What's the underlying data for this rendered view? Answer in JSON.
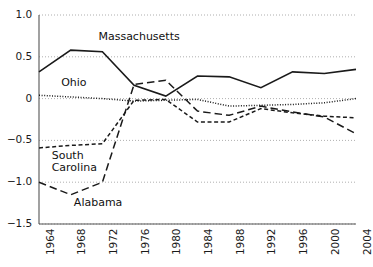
{
  "chart_data": {
    "type": "line",
    "title": "",
    "subtitle": "",
    "xlabel": "",
    "ylabel": "",
    "x": [
      1964,
      1968,
      1972,
      1976,
      1980,
      1984,
      1988,
      1992,
      1996,
      2000,
      2004
    ],
    "xticklabels": [
      "1964",
      "1968",
      "1972",
      "1976",
      "1980",
      "1984",
      "1988",
      "1992",
      "1996",
      "2000",
      "2004"
    ],
    "yticks": [
      1.0,
      0.5,
      0,
      -0.5,
      -1.0,
      -1.5
    ],
    "yticklabels": [
      "1.0",
      "0.5",
      "0",
      "−0.5",
      "−1.0",
      "−1.5"
    ],
    "ylim": [
      -1.5,
      1.0
    ],
    "xlim": [
      1964,
      2004
    ],
    "grid": "horizontal-dotted",
    "legend_position": "inline-annotations",
    "series": [
      {
        "name": "Massachusetts",
        "style": "solid",
        "color": "#1a1a1a",
        "values": [
          0.32,
          0.58,
          0.56,
          0.16,
          0.03,
          0.27,
          0.26,
          0.13,
          0.32,
          0.3,
          0.35
        ]
      },
      {
        "name": "Ohio",
        "style": "dotted",
        "color": "#1a1a1a",
        "values": [
          0.04,
          0.02,
          0.0,
          -0.03,
          -0.02,
          -0.01,
          -0.09,
          -0.08,
          -0.07,
          -0.05,
          0.0
        ]
      },
      {
        "name": "South Carolina",
        "style": "dashed-short",
        "color": "#1a1a1a",
        "values": [
          -0.59,
          -0.56,
          -0.54,
          -0.02,
          -0.01,
          -0.28,
          -0.28,
          -0.12,
          -0.17,
          -0.21,
          -0.23
        ]
      },
      {
        "name": "Alabama",
        "style": "dashed-long",
        "color": "#1a1a1a",
        "values": [
          -1.0,
          -1.15,
          -1.0,
          0.17,
          0.22,
          -0.15,
          -0.2,
          -0.09,
          -0.16,
          -0.22,
          -0.42
        ]
      }
    ],
    "annotations": [
      {
        "text": "Massachusetts",
        "series": "Massachusetts",
        "x": 1971.5,
        "y": 0.73
      },
      {
        "text": "Ohio",
        "series": "Ohio",
        "x": 1966.8,
        "y": 0.18
      },
      {
        "text": "South Carolina",
        "series": "South Carolina",
        "x": 1965.6,
        "y": -0.7
      },
      {
        "text": "Alabama",
        "series": "Alabama",
        "x": 1968.4,
        "y": -1.26
      }
    ]
  }
}
